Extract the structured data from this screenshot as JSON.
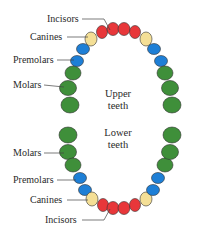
{
  "colors": {
    "incisor": "#e8373a",
    "canine": "#f4df96",
    "premolar": "#1e7fd6",
    "molar": "#3f8f3a",
    "outline": "#333333",
    "leader": "#444444"
  },
  "upper": {
    "center_label_line1": "Upper",
    "center_label_line2": "teeth",
    "labels": {
      "incisors": "Incisors",
      "canines": "Canines",
      "premolars": "Premolars",
      "molars": "Molars"
    }
  },
  "lower": {
    "center_label_line1": "Lower",
    "center_label_line2": "teeth",
    "labels": {
      "molars": "Molars",
      "premolars": "Premolars",
      "canines": "Canines",
      "incisors": "Incisors"
    }
  }
}
